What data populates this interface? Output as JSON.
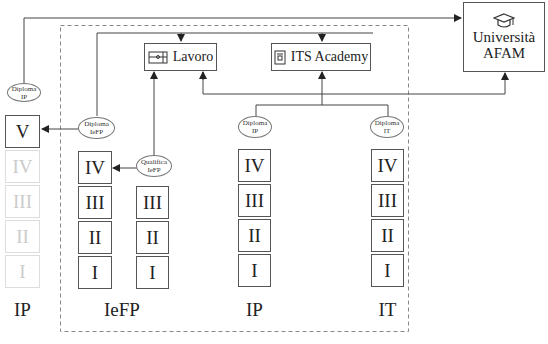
{
  "destinations": {
    "lavoro": {
      "label": "Lavoro",
      "icon": "briefcase-icon"
    },
    "its": {
      "label": "ITS Academy",
      "icon": "book-icon"
    },
    "universita": {
      "line1": "Università",
      "line2": "AFAM",
      "icon": "graduation-cap-icon"
    }
  },
  "ovals": {
    "diploma_ip_left": {
      "line1": "Diploma",
      "line2": "IP"
    },
    "diploma_iefp": {
      "line1": "Diploma",
      "line2": "IeFP"
    },
    "qualifica_iefp": {
      "line1": "Qualifica",
      "line2": "IeFP"
    },
    "diploma_ip": {
      "line1": "Diploma",
      "line2": "IP"
    },
    "diploma_it": {
      "line1": "Diploma",
      "line2": "IT"
    }
  },
  "columns": {
    "ip_left": {
      "label": "IP",
      "years": [
        "V",
        "IV",
        "III",
        "II",
        "I"
      ]
    },
    "iefp": {
      "label": "IeFP",
      "years_a": [
        "IV",
        "III",
        "II",
        "I"
      ],
      "years_b": [
        "III",
        "II",
        "I"
      ]
    },
    "ip": {
      "label": "IP",
      "years": [
        "IV",
        "III",
        "II",
        "I"
      ]
    },
    "it": {
      "label": "IT",
      "years": [
        "IV",
        "III",
        "II",
        "I"
      ]
    }
  }
}
